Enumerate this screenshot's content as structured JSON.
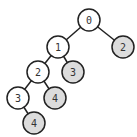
{
  "diagram": {
    "type": "binary-tree",
    "colors": {
      "default_fill": "#ffffff",
      "highlight_fill": "#dcdcdc",
      "stroke": "#222222",
      "text": "#333333"
    },
    "nodes": [
      {
        "id": "n0",
        "label": "0",
        "x": 89,
        "y": 20,
        "shaded": false
      },
      {
        "id": "n1",
        "label": "1",
        "x": 58,
        "y": 47,
        "shaded": false
      },
      {
        "id": "n2r",
        "label": "2",
        "x": 123,
        "y": 47,
        "shaded": true
      },
      {
        "id": "n2",
        "label": "2",
        "x": 38,
        "y": 72,
        "shaded": false
      },
      {
        "id": "n3r",
        "label": "3",
        "x": 73,
        "y": 72,
        "shaded": true
      },
      {
        "id": "n3",
        "label": "3",
        "x": 18,
        "y": 98,
        "shaded": false
      },
      {
        "id": "n4r",
        "label": "4",
        "x": 55,
        "y": 98,
        "shaded": true
      },
      {
        "id": "n4",
        "label": "4",
        "x": 34,
        "y": 123,
        "shaded": true
      }
    ],
    "edges": [
      {
        "from": "n0",
        "to": "n1"
      },
      {
        "from": "n0",
        "to": "n2r"
      },
      {
        "from": "n1",
        "to": "n2"
      },
      {
        "from": "n1",
        "to": "n3r"
      },
      {
        "from": "n2",
        "to": "n3"
      },
      {
        "from": "n2",
        "to": "n4r"
      },
      {
        "from": "n3",
        "to": "n4"
      }
    ]
  }
}
